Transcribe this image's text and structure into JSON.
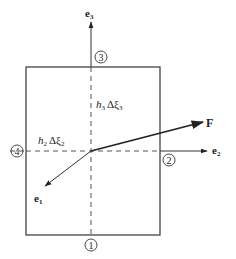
{
  "diagram": {
    "type": "coordinate-cell-element",
    "colors": {
      "line": "#333333",
      "dashed": "#555555",
      "background": "#ffffff"
    },
    "box": {
      "x": 26,
      "y": 67,
      "width": 134,
      "height": 168
    },
    "center": {
      "x": 91,
      "y": 151
    },
    "vectors": {
      "e1": {
        "label": "e",
        "sub": "1"
      },
      "e2": {
        "label": "e",
        "sub": "2"
      },
      "e3": {
        "label": "e",
        "sub": "3"
      },
      "F": {
        "label": "F"
      }
    },
    "faces": [
      {
        "id": "1",
        "label": "1"
      },
      {
        "id": "2",
        "label": "2"
      },
      {
        "id": "3",
        "label": "3"
      },
      {
        "id": "4",
        "label": "4"
      }
    ],
    "dimensions": {
      "h3": {
        "h": "h",
        "hsub": "3",
        "delta": "Δ",
        "xi": "ξ",
        "xisub": "3"
      },
      "h2": {
        "h": "h",
        "hsub": "2",
        "delta": "Δ",
        "xi": "ξ",
        "xisub": "2"
      }
    }
  }
}
